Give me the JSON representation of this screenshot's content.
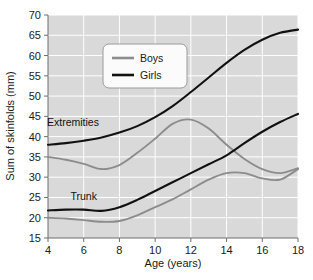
{
  "chart_data": {
    "type": "line",
    "title": "",
    "xlabel": "Age (years)",
    "ylabel": "Sum of skinfolds (mm)",
    "xlim": [
      4,
      18
    ],
    "ylim": [
      15,
      70
    ],
    "xticks": [
      4,
      6,
      8,
      10,
      12,
      14,
      16,
      18
    ],
    "yticks": [
      15,
      20,
      25,
      30,
      35,
      40,
      45,
      50,
      55,
      60,
      65,
      70
    ],
    "grid": true,
    "legend_position": "upper-center-left",
    "legend_entries": [
      {
        "name": "Boys",
        "color": "#8c8c8c"
      },
      {
        "name": "Girls",
        "color": "#111111"
      }
    ],
    "annotations": [
      {
        "text": "Extremities",
        "x": 5.4,
        "y": 42.6
      },
      {
        "text": "Trunk",
        "x": 6.0,
        "y": 24.4
      }
    ],
    "x": [
      4,
      5,
      6,
      7,
      8,
      9,
      10,
      11,
      12,
      13,
      14,
      15,
      16,
      17,
      18
    ],
    "series": [
      {
        "name": "Girls Extremities",
        "group": "Extremities",
        "sex": "Girls",
        "color": "#111111",
        "values": [
          38.0,
          38.4,
          39.0,
          39.8,
          41.0,
          42.6,
          44.8,
          47.6,
          51.0,
          54.6,
          58.2,
          61.4,
          63.9,
          65.6,
          66.4
        ]
      },
      {
        "name": "Boys Extremities",
        "group": "Extremities",
        "sex": "Boys",
        "color": "#8c8c8c",
        "values": [
          35.0,
          34.3,
          33.3,
          32.0,
          33.0,
          36.0,
          39.5,
          43.2,
          44.2,
          42.0,
          38.0,
          34.5,
          32.0,
          31.0,
          32.2
        ]
      },
      {
        "name": "Girls Trunk",
        "group": "Trunk",
        "sex": "Girls",
        "color": "#111111",
        "values": [
          21.8,
          22.0,
          22.0,
          21.7,
          22.6,
          24.4,
          26.6,
          28.8,
          31.0,
          33.2,
          35.4,
          38.4,
          41.2,
          43.6,
          45.6
        ]
      },
      {
        "name": "Boys Trunk",
        "group": "Trunk",
        "sex": "Boys",
        "color": "#8c8c8c",
        "values": [
          20.0,
          19.8,
          19.4,
          19.0,
          19.2,
          20.6,
          22.6,
          24.6,
          27.0,
          29.4,
          31.0,
          31.0,
          29.7,
          29.4,
          32.0
        ]
      }
    ]
  },
  "plot": {
    "background_color": "#d9d9d9",
    "gridline_color": "#ffffff",
    "axis_color": "#6e6e6e",
    "boys_color": "#8c8c8c",
    "girls_color": "#111111"
  },
  "legend": {
    "boys_label": "Boys",
    "girls_label": "Girls",
    "background_color": "#fbfbfb",
    "border_color": "#9a9a9a"
  },
  "annotations": {
    "extremities_label": "Extremities",
    "trunk_label": "Trunk"
  },
  "axes": {
    "x_title": "Age (years)",
    "y_title": "Sum of skinfolds (mm)",
    "x_tick_labels": [
      "4",
      "6",
      "8",
      "10",
      "12",
      "14",
      "16",
      "18"
    ],
    "y_tick_labels": [
      "15",
      "20",
      "25",
      "30",
      "35",
      "40",
      "45",
      "50",
      "55",
      "60",
      "65",
      "70"
    ]
  }
}
